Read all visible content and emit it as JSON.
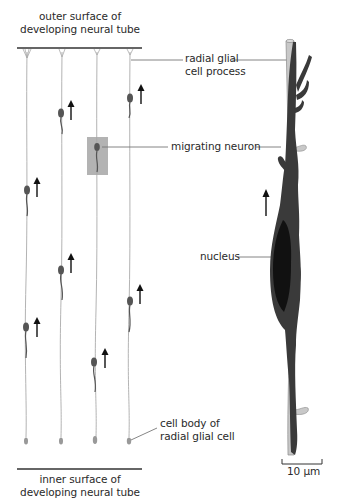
{
  "figure": {
    "left_panel": {
      "top_label": [
        "outer surface of",
        "developing neural tube"
      ],
      "bottom_label": [
        "inner surface of",
        "developing neural tube"
      ],
      "fiber_count": 4,
      "neurons_per_fiber": 2,
      "highlight_box_color": "#a6a6a6"
    },
    "right_panel": {
      "labels": {
        "glial_process": [
          "radial glial",
          "cell process"
        ],
        "migrating_neuron": "migrating neuron",
        "nucleus": "nucleus",
        "glial_cell_body": [
          "cell body of",
          "radial glial cell"
        ]
      },
      "scale_bar": "10 µm"
    },
    "colors": {
      "neuron": "#3a3a3a",
      "neuron_small": "#555555",
      "glial_fiber": "#c8c8c8",
      "glial_outline": "#8a8a8a",
      "nucleus": "#111111",
      "leader_line": "#777777",
      "surface_line": "#333333"
    }
  }
}
